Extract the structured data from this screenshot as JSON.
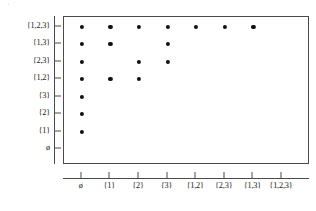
{
  "chart_data": {
    "type": "scatter",
    "title": "",
    "subtitle": "",
    "xlabel": "",
    "ylabel": "",
    "grid": false,
    "legend": null,
    "categories_x": [
      "ø",
      "{1}",
      "{2}",
      "{3}",
      "{1,2}",
      "{2,3}",
      "{1,3}",
      "{1,2,3}"
    ],
    "categories_y_top_to_bottom": [
      "{1,2,3}",
      "{1,3}",
      "{2,3}",
      "{1,2}",
      "{3}",
      "{2}",
      "{1}",
      "ø"
    ],
    "xlim": [
      0,
      8
    ],
    "ylim": [
      0,
      8
    ],
    "point_count": 19,
    "points": [
      {
        "x": "ø",
        "y": "{1,2,3}"
      },
      {
        "x": "{1}",
        "y": "{1,2,3}"
      },
      {
        "x": "{2}",
        "y": "{1,2,3}"
      },
      {
        "x": "{3}",
        "y": "{1,2,3}"
      },
      {
        "x": "{1,2}",
        "y": "{1,2,3}"
      },
      {
        "x": "{2,3}",
        "y": "{1,2,3}"
      },
      {
        "x": "{1,3}",
        "y": "{1,2,3}"
      },
      {
        "x": "ø",
        "y": "{1,3}"
      },
      {
        "x": "{1}",
        "y": "{1,3}"
      },
      {
        "x": "{3}",
        "y": "{1,3}"
      },
      {
        "x": "ø",
        "y": "{2,3}"
      },
      {
        "x": "{2}",
        "y": "{2,3}"
      },
      {
        "x": "{3}",
        "y": "{2,3}"
      },
      {
        "x": "ø",
        "y": "{1,2}"
      },
      {
        "x": "{1}",
        "y": "{1,2}"
      },
      {
        "x": "{2}",
        "y": "{1,2}"
      },
      {
        "x": "ø",
        "y": "{3}"
      },
      {
        "x": "ø",
        "y": "{2}"
      },
      {
        "x": "ø",
        "y": "{1}"
      }
    ]
  },
  "axes": {
    "x_ticks": [
      "ø",
      "{1}",
      "{2}",
      "{3}",
      "{1,2}",
      "{2,3}",
      "{1,3}",
      "{1,2,3}"
    ],
    "y_ticks": [
      "{1,2,3}",
      "{1,3}",
      "{2,3}",
      "{1,2}",
      "{3}",
      "{2}",
      "{1}",
      "ø"
    ]
  },
  "marks": {
    "corner": "·"
  },
  "colors": {
    "point": "#111111",
    "axis": "#4a4a4a",
    "frame": "#4a4a4a",
    "background": "#ffffff",
    "text": "#1a1a1a"
  }
}
